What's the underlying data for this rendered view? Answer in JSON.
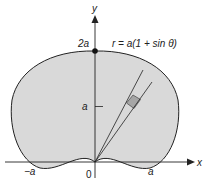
{
  "diagram": {
    "equation": "r = a(1 + sin θ)",
    "axes": {
      "x_label": "x",
      "y_label": "y"
    },
    "tick_labels": {
      "neg_a": "−a",
      "origin": "0",
      "pos_a": "a",
      "y_a": "a",
      "y_2a": "2a"
    },
    "colors": {
      "fill": "#d9d9d9",
      "patch": "#a6a6a6",
      "stroke": "#222222"
    }
  }
}
